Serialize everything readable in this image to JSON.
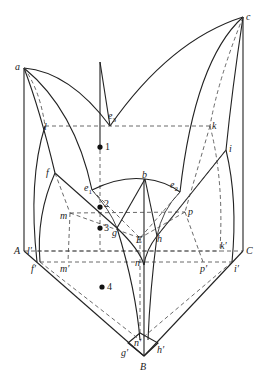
{
  "diagram": {
    "type": "ternary-phase-space-diagram",
    "vertex_labels": {
      "a": "a",
      "c": "c",
      "b": "b",
      "A": "A",
      "B": "B",
      "C": "C"
    },
    "eutectic_labels": {
      "e1": "e",
      "e1_sub": "1",
      "e2": "e",
      "e2_sub": "2",
      "e3": "e",
      "e3_sub": "3",
      "E": "E"
    },
    "point_labels": {
      "f": "f",
      "g": "g",
      "h": "h",
      "i": "i",
      "k": "k",
      "l": "l",
      "m": "m",
      "n": "n",
      "p": "p",
      "f_prime": "f′",
      "g_prime": "g′",
      "h_prime": "h′",
      "i_prime": "i′",
      "k_prime": "k′",
      "l_prime": "l′",
      "m_prime": "m′",
      "n_prime": "n′",
      "p_prime": "p′"
    },
    "composition_points": [
      {
        "label": "1"
      },
      {
        "label": "2"
      },
      {
        "label": "3"
      },
      {
        "label": "4"
      }
    ],
    "colors": {
      "line": "#222222",
      "background": "#ffffff"
    }
  }
}
